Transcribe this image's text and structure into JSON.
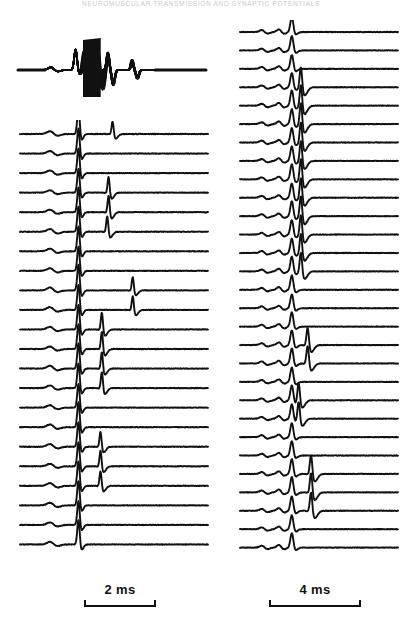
{
  "figure": {
    "running_head": "NEUROMUSCULAR TRANSMISSION AND SYNAPTIC POTENTIALS",
    "background_color": "#ffffff",
    "trace_color": "#111111",
    "width": 402,
    "height": 625
  },
  "panels": {
    "overlay": {
      "name": "superimposed-sweeps",
      "label": "",
      "description": "Superimposed record of many sweeps forming a solid black envelope",
      "x": 12,
      "y": 26,
      "width": 200,
      "height": 74,
      "sweep_count": 40
    },
    "left_stack": {
      "name": "left-sweep-stack",
      "label": "",
      "x": 12,
      "y": 120,
      "width": 200,
      "height": 452,
      "trace_count": 22,
      "trace_spacing_px": 20.5
    },
    "right_stack": {
      "name": "right-sweep-stack",
      "label": "",
      "x": 232,
      "y": 20,
      "width": 170,
      "height": 552,
      "trace_count": 29,
      "trace_spacing_px": 19.0
    }
  },
  "scalebars": {
    "left": {
      "label": "2 ms",
      "value": 2,
      "unit": "ms",
      "bar_length_px": 72
    },
    "right": {
      "label": "4 ms",
      "value": 4,
      "unit": "ms",
      "bar_length_px": 92
    }
  },
  "chart_data": {
    "type": "line",
    "title": "",
    "xlabel": "Time",
    "ylabel": "Membrane potential",
    "legend": [],
    "grid": false,
    "panels": [
      {
        "id": "overlay",
        "type": "superimposed-sweeps",
        "x_unit": "ms",
        "x_range": [
          0,
          7
        ],
        "description": "Many sweeps superimposed; a dense black band of stimulus artifact and spike activity",
        "features": [
          {
            "name": "baseline",
            "x": 0.0,
            "amplitude": 0.0
          },
          {
            "name": "small-prepotential",
            "x": 1.25,
            "amplitude": 0.18
          },
          {
            "name": "first-spike",
            "x": 2.15,
            "amplitude": 0.85
          },
          {
            "name": "solid-burst-envelope",
            "x_start": 2.4,
            "x_end": 3.1,
            "amplitude": 1.0
          },
          {
            "name": "second-spike",
            "x": 3.35,
            "amplitude": 0.78
          },
          {
            "name": "undershoot",
            "x": 3.55,
            "amplitude": -0.62
          },
          {
            "name": "third-spike",
            "x": 4.25,
            "amplitude": 0.45
          },
          {
            "name": "undershoot-2",
            "x": 4.45,
            "amplitude": -0.38
          },
          {
            "name": "return-to-baseline",
            "x": 5.2,
            "amplitude": 0.0
          }
        ]
      },
      {
        "id": "left_stack",
        "type": "stacked-sweeps",
        "x_unit": "ms",
        "x_range": [
          0,
          7
        ],
        "scalebar_ms": 2,
        "n_traces": 22,
        "description": "Stack of 22 consecutive sweeps; each shows a small early deflection, a large fixed-latency spike, and in some sweeps a later variable-latency spike",
        "traces": [
          {
            "index": 1,
            "prepotential": 0.22,
            "main_spike": 0.95,
            "late_spike_x": 3.45,
            "late_spike_amp": 0.55
          },
          {
            "index": 2,
            "prepotential": 0.2,
            "main_spike": 0.92,
            "late_spike_x": null,
            "late_spike_amp": 0
          },
          {
            "index": 3,
            "prepotential": 0.21,
            "main_spike": 0.9,
            "late_spike_x": null,
            "late_spike_amp": 0
          },
          {
            "index": 4,
            "prepotential": 0.19,
            "main_spike": 0.88,
            "late_spike_x": 3.3,
            "late_spike_amp": 0.7
          },
          {
            "index": 5,
            "prepotential": 0.2,
            "main_spike": 0.9,
            "late_spike_x": 3.3,
            "late_spike_amp": 0.72
          },
          {
            "index": 6,
            "prepotential": 0.22,
            "main_spike": 0.93,
            "late_spike_x": 3.25,
            "late_spike_amp": 0.68
          },
          {
            "index": 7,
            "prepotential": 0.21,
            "main_spike": 0.91,
            "late_spike_x": null,
            "late_spike_amp": 0
          },
          {
            "index": 8,
            "prepotential": 0.2,
            "main_spike": 0.89,
            "late_spike_x": null,
            "late_spike_amp": 0
          },
          {
            "index": 9,
            "prepotential": 0.23,
            "main_spike": 0.94,
            "late_spike_x": 4.2,
            "late_spike_amp": 0.58
          },
          {
            "index": 10,
            "prepotential": 0.22,
            "main_spike": 0.92,
            "late_spike_x": 4.2,
            "late_spike_amp": 0.6
          },
          {
            "index": 11,
            "prepotential": 0.21,
            "main_spike": 0.9,
            "late_spike_x": 3.05,
            "late_spike_amp": 0.74
          },
          {
            "index": 12,
            "prepotential": 0.2,
            "main_spike": 0.91,
            "late_spike_x": 3.05,
            "late_spike_amp": 0.76
          },
          {
            "index": 13,
            "prepotential": 0.22,
            "main_spike": 0.93,
            "late_spike_x": 3.05,
            "late_spike_amp": 0.72
          },
          {
            "index": 14,
            "prepotential": 0.21,
            "main_spike": 0.9,
            "late_spike_x": 3.05,
            "late_spike_amp": 0.7
          },
          {
            "index": 15,
            "prepotential": 0.2,
            "main_spike": 0.88,
            "late_spike_x": null,
            "late_spike_amp": 0
          },
          {
            "index": 16,
            "prepotential": 0.22,
            "main_spike": 0.92,
            "late_spike_x": null,
            "late_spike_amp": 0
          },
          {
            "index": 17,
            "prepotential": 0.21,
            "main_spike": 0.9,
            "late_spike_x": 3.0,
            "late_spike_amp": 0.66
          },
          {
            "index": 18,
            "prepotential": 0.2,
            "main_spike": 0.89,
            "late_spike_x": 3.0,
            "late_spike_amp": 0.68
          },
          {
            "index": 19,
            "prepotential": 0.22,
            "main_spike": 0.91,
            "late_spike_x": 3.0,
            "late_spike_amp": 0.64
          },
          {
            "index": 20,
            "prepotential": 0.21,
            "main_spike": 0.9,
            "late_spike_x": null,
            "late_spike_amp": 0
          },
          {
            "index": 21,
            "prepotential": 0.2,
            "main_spike": 0.88,
            "late_spike_x": null,
            "late_spike_amp": 0
          },
          {
            "index": 22,
            "prepotential": 0.21,
            "main_spike": 0.89,
            "late_spike_x": null,
            "late_spike_amp": 0
          }
        ]
      },
      {
        "id": "right_stack",
        "type": "stacked-sweeps",
        "x_unit": "ms",
        "x_range": [
          0,
          14
        ],
        "scalebar_ms": 4,
        "n_traces": 29,
        "description": "Stack of 29 consecutive sweeps at slower sweep speed; each shows two early humps, a constant-latency spike, and in many sweeps a second larger spike of variable latency",
        "traces": [
          {
            "index": 1,
            "hump1": 0.16,
            "hump2": 0.2,
            "main_spike": 0.62,
            "late_spike_x": null,
            "late_spike_amp": 0
          },
          {
            "index": 2,
            "hump1": 0.15,
            "hump2": 0.19,
            "main_spike": 0.6,
            "late_spike_x": null,
            "late_spike_amp": 0
          },
          {
            "index": 3,
            "hump1": 0.16,
            "hump2": 0.2,
            "main_spike": 0.58,
            "late_spike_x": null,
            "late_spike_amp": 0
          },
          {
            "index": 4,
            "hump1": 0.15,
            "hump2": 0.19,
            "main_spike": 0.6,
            "late_spike_x": 5.4,
            "late_spike_amp": 0.95
          },
          {
            "index": 5,
            "hump1": 0.16,
            "hump2": 0.21,
            "main_spike": 0.64,
            "late_spike_x": 5.4,
            "late_spike_amp": 0.98
          },
          {
            "index": 6,
            "hump1": 0.15,
            "hump2": 0.2,
            "main_spike": 0.62,
            "late_spike_x": 5.4,
            "late_spike_amp": 1.0
          },
          {
            "index": 7,
            "hump1": 0.16,
            "hump2": 0.19,
            "main_spike": 0.6,
            "late_spike_x": 5.4,
            "late_spike_amp": 0.96
          },
          {
            "index": 8,
            "hump1": 0.15,
            "hump2": 0.2,
            "main_spike": 0.61,
            "late_spike_x": 5.4,
            "late_spike_amp": 0.94
          },
          {
            "index": 9,
            "hump1": 0.16,
            "hump2": 0.2,
            "main_spike": 0.63,
            "late_spike_x": 5.4,
            "late_spike_amp": 0.97
          },
          {
            "index": 10,
            "hump1": 0.15,
            "hump2": 0.19,
            "main_spike": 0.6,
            "late_spike_x": 5.4,
            "late_spike_amp": 0.93
          },
          {
            "index": 11,
            "hump1": 0.16,
            "hump2": 0.2,
            "main_spike": 0.62,
            "late_spike_x": 5.4,
            "late_spike_amp": 0.95
          },
          {
            "index": 12,
            "hump1": 0.15,
            "hump2": 0.2,
            "main_spike": 0.61,
            "late_spike_x": 5.4,
            "late_spike_amp": 0.92
          },
          {
            "index": 13,
            "hump1": 0.16,
            "hump2": 0.19,
            "main_spike": 0.6,
            "late_spike_x": 5.4,
            "late_spike_amp": 0.9
          },
          {
            "index": 14,
            "hump1": 0.15,
            "hump2": 0.2,
            "main_spike": 0.62,
            "late_spike_x": 5.4,
            "late_spike_amp": 0.88
          },
          {
            "index": 15,
            "hump1": 0.16,
            "hump2": 0.2,
            "main_spike": 0.6,
            "late_spike_x": null,
            "late_spike_amp": 0
          },
          {
            "index": 16,
            "hump1": 0.15,
            "hump2": 0.19,
            "main_spike": 0.58,
            "late_spike_x": null,
            "late_spike_amp": 0
          },
          {
            "index": 17,
            "hump1": 0.16,
            "hump2": 0.2,
            "main_spike": 0.6,
            "late_spike_x": null,
            "late_spike_amp": 0
          },
          {
            "index": 18,
            "hump1": 0.15,
            "hump2": 0.2,
            "main_spike": 0.61,
            "late_spike_x": 6.0,
            "late_spike_amp": 0.8
          },
          {
            "index": 19,
            "hump1": 0.16,
            "hump2": 0.21,
            "main_spike": 0.63,
            "late_spike_x": 6.0,
            "late_spike_amp": 0.82
          },
          {
            "index": 20,
            "hump1": 0.15,
            "hump2": 0.19,
            "main_spike": 0.6,
            "late_spike_x": null,
            "late_spike_amp": 0
          },
          {
            "index": 21,
            "hump1": 0.16,
            "hump2": 0.2,
            "main_spike": 0.62,
            "late_spike_x": 5.2,
            "late_spike_amp": 0.85
          },
          {
            "index": 22,
            "hump1": 0.15,
            "hump2": 0.2,
            "main_spike": 0.6,
            "late_spike_x": 5.2,
            "late_spike_amp": 0.83
          },
          {
            "index": 23,
            "hump1": 0.16,
            "hump2": 0.19,
            "main_spike": 0.58,
            "late_spike_x": null,
            "late_spike_amp": 0
          },
          {
            "index": 24,
            "hump1": 0.15,
            "hump2": 0.2,
            "main_spike": 0.6,
            "late_spike_x": null,
            "late_spike_amp": 0
          },
          {
            "index": 25,
            "hump1": 0.16,
            "hump2": 0.2,
            "main_spike": 0.62,
            "late_spike_x": 6.3,
            "late_spike_amp": 0.88
          },
          {
            "index": 26,
            "hump1": 0.15,
            "hump2": 0.21,
            "main_spike": 0.64,
            "late_spike_x": 6.3,
            "late_spike_amp": 0.9
          },
          {
            "index": 27,
            "hump1": 0.16,
            "hump2": 0.2,
            "main_spike": 0.6,
            "late_spike_x": 6.3,
            "late_spike_amp": 0.86
          },
          {
            "index": 28,
            "hump1": 0.15,
            "hump2": 0.19,
            "main_spike": 0.58,
            "late_spike_x": null,
            "late_spike_amp": 0
          },
          {
            "index": 29,
            "hump1": 0.16,
            "hump2": 0.2,
            "main_spike": 0.6,
            "late_spike_x": null,
            "late_spike_amp": 0
          }
        ]
      }
    ]
  }
}
